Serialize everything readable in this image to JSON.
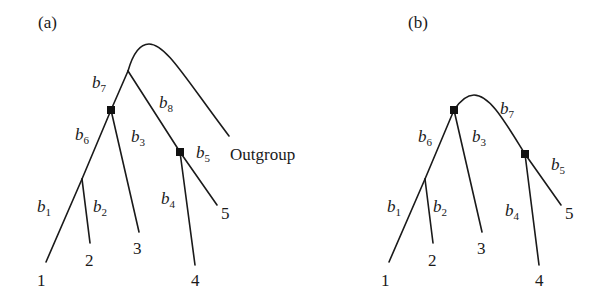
{
  "figure": {
    "panels": [
      {
        "id": "a",
        "label": "(a)",
        "description": "Rooted tree with outgroup",
        "outgroup_label": "Outgroup",
        "leaves": [
          "1",
          "2",
          "3",
          "4",
          "5"
        ],
        "branches": [
          {
            "name": "b",
            "sub": "1"
          },
          {
            "name": "b",
            "sub": "2"
          },
          {
            "name": "b",
            "sub": "3"
          },
          {
            "name": "b",
            "sub": "4"
          },
          {
            "name": "b",
            "sub": "5"
          },
          {
            "name": "b",
            "sub": "6"
          },
          {
            "name": "b",
            "sub": "7"
          },
          {
            "name": "b",
            "sub": "8"
          }
        ]
      },
      {
        "id": "b",
        "label": "(b)",
        "description": "Unrooted tree without outgroup",
        "leaves": [
          "1",
          "2",
          "3",
          "4",
          "5"
        ],
        "branches": [
          {
            "name": "b",
            "sub": "1"
          },
          {
            "name": "b",
            "sub": "2"
          },
          {
            "name": "b",
            "sub": "3"
          },
          {
            "name": "b",
            "sub": "4"
          },
          {
            "name": "b",
            "sub": "5"
          },
          {
            "name": "b",
            "sub": "6"
          },
          {
            "name": "b",
            "sub": "7"
          }
        ]
      }
    ],
    "colors": {
      "line": "#1a1a1a",
      "node": "#111111",
      "background": "#ffffff"
    }
  }
}
